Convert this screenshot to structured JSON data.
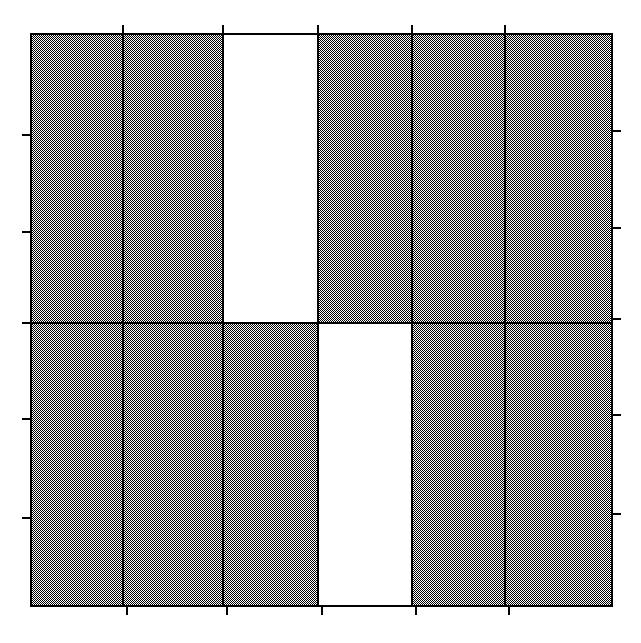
{
  "figure": {
    "width": 641,
    "height": 643,
    "background": "#ffffff",
    "type": "mosaic-plot"
  },
  "style": {
    "fill_pattern": "checkerboard-50-dither",
    "fill_color": "#808080",
    "fill_dark": "#000000",
    "fill_light": "#ffffff",
    "empty_fill": "#ffffff",
    "line_color": "#000000",
    "border_width": 2,
    "divider_width": 2,
    "tick_width": 2,
    "tick_length": 9
  },
  "axes": {
    "plot_left": 31,
    "plot_right": 612,
    "plot_top": 34,
    "plot_bottom": 606,
    "x_tick_positions": [
      123,
      223,
      318,
      412,
      505
    ],
    "y_tick_positions": [
      135,
      232,
      323,
      419,
      518
    ],
    "top_ticks": true,
    "bottom_ticks": true,
    "left_ticks": true,
    "right_ticks": true,
    "tick_labels": [],
    "axis_labels": []
  },
  "chart_data": {
    "type": "heatmap",
    "title": "",
    "subtitle": "",
    "xlabel": "",
    "ylabel": "",
    "xlim": [
      31,
      612
    ],
    "ylim": [
      34,
      606
    ],
    "grid": false,
    "legend": null,
    "n_columns": 6,
    "n_rows": 2,
    "column_labels": [
      "1",
      "2",
      "3",
      "4",
      "5",
      "6"
    ],
    "row_labels": [
      "1",
      "2"
    ],
    "column_edges": [
      31,
      123,
      223,
      318,
      412,
      505,
      612
    ],
    "row_edges": [
      34,
      323,
      606
    ],
    "column_widths": [
      92,
      100,
      95,
      94,
      93,
      107
    ],
    "row_heights": [
      289,
      283
    ],
    "cells": [
      {
        "row": 0,
        "col": 0,
        "filled": true,
        "x": 31,
        "y": 34,
        "w": 92,
        "h": 289
      },
      {
        "row": 0,
        "col": 1,
        "filled": true,
        "x": 123,
        "y": 34,
        "w": 100,
        "h": 289
      },
      {
        "row": 0,
        "col": 2,
        "filled": false,
        "x": 223,
        "y": 34,
        "w": 95,
        "h": 289
      },
      {
        "row": 0,
        "col": 3,
        "filled": true,
        "x": 318,
        "y": 34,
        "w": 94,
        "h": 289
      },
      {
        "row": 0,
        "col": 4,
        "filled": true,
        "x": 412,
        "y": 34,
        "w": 93,
        "h": 289
      },
      {
        "row": 0,
        "col": 5,
        "filled": true,
        "x": 505,
        "y": 34,
        "w": 107,
        "h": 289
      },
      {
        "row": 1,
        "col": 0,
        "filled": true,
        "x": 31,
        "y": 323,
        "w": 92,
        "h": 283
      },
      {
        "row": 1,
        "col": 1,
        "filled": true,
        "x": 123,
        "y": 323,
        "w": 100,
        "h": 283
      },
      {
        "row": 1,
        "col": 2,
        "filled": true,
        "x": 223,
        "y": 323,
        "w": 95,
        "h": 283
      },
      {
        "row": 1,
        "col": 3,
        "filled": false,
        "x": 318,
        "y": 323,
        "w": 94,
        "h": 283
      },
      {
        "row": 1,
        "col": 4,
        "filled": true,
        "x": 412,
        "y": 323,
        "w": 93,
        "h": 283
      },
      {
        "row": 1,
        "col": 5,
        "filled": true,
        "x": 505,
        "y": 323,
        "w": 107,
        "h": 283
      }
    ],
    "values": [
      [
        1,
        1,
        0,
        1,
        1,
        1
      ],
      [
        1,
        1,
        1,
        0,
        1,
        1
      ]
    ]
  }
}
